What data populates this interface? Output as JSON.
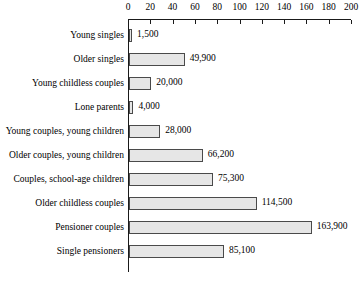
{
  "chart_data": {
    "type": "bar",
    "orientation": "horizontal",
    "title": "",
    "subtitle": "",
    "xlabel": "",
    "ylabel": "",
    "xlim": [
      0,
      200
    ],
    "grid": false,
    "legend": null,
    "axis_units_note": "",
    "tick_labels": [
      "0",
      "20",
      "40",
      "60",
      "80",
      "100",
      "120",
      "140",
      "160",
      "180",
      "200"
    ],
    "ticks": [
      0,
      20,
      40,
      60,
      80,
      100,
      120,
      140,
      160,
      180,
      200
    ],
    "categories": [
      "Young singles",
      "Older singles",
      "Young childless couples",
      "Lone parents",
      "Young couples, young children",
      "Older couples, young children",
      "Couples, school-age children",
      "Older childless couples",
      "Pensioner couples",
      "Single pensioners"
    ],
    "values": [
      1500,
      49900,
      20000,
      4000,
      28000,
      66200,
      75300,
      114500,
      163900,
      85100
    ],
    "value_labels": [
      "1,500",
      "49,900",
      "20,000",
      "4,000",
      "28,000",
      "66,200",
      "75,300",
      "114,500",
      "163,900",
      "85,100"
    ],
    "bar_fill_color": "#e6e6e6",
    "bar_border_color": "#4a4a4a",
    "axis_color": "#1a1a1a",
    "background_color": "#ffffff"
  }
}
